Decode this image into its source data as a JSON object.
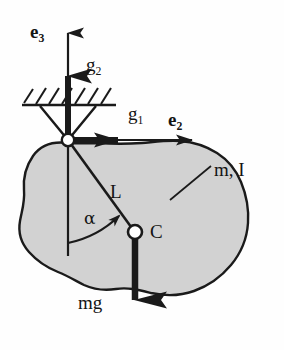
{
  "figure": {
    "kind": "mechanics-free-body-diagram",
    "background_color": "#fefefe",
    "body_fill_color": "#d2d2d2",
    "stroke_color": "#1a1a1a"
  },
  "labels": {
    "e3": {
      "base": "e",
      "sub": "3",
      "style": "bold-vector"
    },
    "g2": {
      "base": "g",
      "sub": "2",
      "style": "roman"
    },
    "g1": {
      "base": "g",
      "sub": "1",
      "style": "roman"
    },
    "e2": {
      "base": "e",
      "sub": "2",
      "style": "bold-vector"
    },
    "mass_inertia": "m, I",
    "length": "L",
    "angle": "α",
    "center_of_mass": "C",
    "weight": "mg"
  },
  "geometry": {
    "pivot": {
      "x": 68,
      "y": 140
    },
    "center_of_mass_point": {
      "x": 135,
      "y": 232
    },
    "ground_line_y": 105,
    "ground_line_x_start": 22,
    "ground_line_x_end": 116
  },
  "elements": [
    {
      "name": "axis-arrow-e3",
      "type": "arrow",
      "weight": "thin",
      "direction": "up"
    },
    {
      "name": "axis-arrow-e2",
      "type": "arrow",
      "weight": "thin",
      "direction": "right"
    },
    {
      "name": "gravity-arrow-g2",
      "type": "arrow",
      "weight": "thick",
      "direction": "up"
    },
    {
      "name": "gravity-arrow-g1",
      "type": "arrow",
      "weight": "thick",
      "direction": "right"
    },
    {
      "name": "weight-arrow-mg",
      "type": "arrow",
      "weight": "thick",
      "direction": "down"
    },
    {
      "name": "rigid-body-blob",
      "type": "shape",
      "fill": "#d2d2d2"
    },
    {
      "name": "ground-hatching",
      "type": "hatch"
    },
    {
      "name": "pivot-support-wedge",
      "type": "triangle"
    },
    {
      "name": "pivot-joint",
      "type": "circle",
      "fill": "#ffffff"
    },
    {
      "name": "com-marker",
      "type": "circle",
      "fill": "#ffffff"
    },
    {
      "name": "length-line-L",
      "type": "line"
    },
    {
      "name": "angle-arc-alpha",
      "type": "arc-arrow"
    },
    {
      "name": "vertical-reference-line",
      "type": "line"
    },
    {
      "name": "leader-line-mass-inertia",
      "type": "line"
    }
  ]
}
